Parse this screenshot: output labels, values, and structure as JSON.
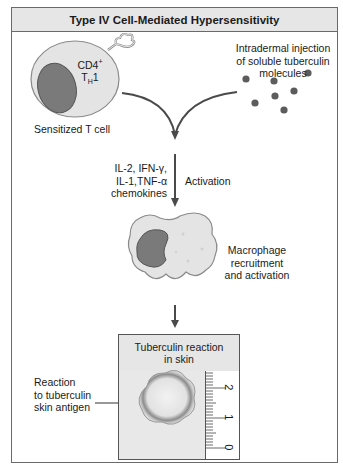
{
  "title": "Type IV Cell-Mediated Hypersensitivity",
  "t_cell": {
    "marker_line1": "CD4",
    "marker_sup": "+",
    "marker_line2_main": "T",
    "marker_line2_sub": "H",
    "marker_line2_end": "1",
    "label": "Sensitized T cell"
  },
  "injection": {
    "line1": "Intradermal injection",
    "line2": "of soluble tuberculin",
    "line3": "molecules"
  },
  "cytokines": {
    "line1": "IL-2, IFN-γ,",
    "line2": "IL-1,TNF-α",
    "line3": "chemokines"
  },
  "activation_label": "Activation",
  "macrophage": {
    "line1": "Macrophage",
    "line2": "recruitment",
    "line3": "and activation"
  },
  "skin_box": {
    "header_line1": "Tuberculin reaction",
    "header_line2": "in skin",
    "ruler_labels": [
      "2",
      "1",
      "0"
    ]
  },
  "reaction_label": {
    "line1": "Reaction",
    "line2": "to tuberculin",
    "line3": "skin antigen"
  },
  "colors": {
    "cell_fill": "#e4e4e4",
    "nucleus_fill": "#7a7a7a",
    "arrow": "#4a4a4a",
    "dot": "#5c5c5c",
    "header_bg": "#e6e6e6"
  }
}
